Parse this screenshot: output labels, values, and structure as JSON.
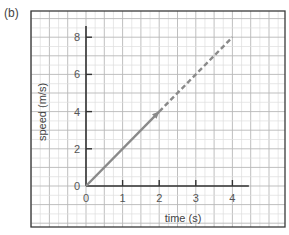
{
  "panel_label": "(b)",
  "colors": {
    "frame": "#3a3a3a",
    "axis": "#333333",
    "grid_major": "#b8b8b8",
    "grid_minor": "#dedede",
    "line": "#8a8a8a",
    "text": "#555555"
  },
  "chart_data": {
    "type": "line",
    "title": "",
    "xlabel": "time (s)",
    "ylabel": "speed (m/s)",
    "xlim": [
      0,
      4
    ],
    "ylim": [
      0,
      8
    ],
    "x_ticks": [
      "0",
      "1",
      "2",
      "3",
      "4"
    ],
    "y_ticks": [
      "0",
      "2",
      "4",
      "6",
      "8"
    ],
    "grid": true,
    "legend": null,
    "series": [
      {
        "name": "measured (solid, with arrow)",
        "style": "solid",
        "x": [
          0,
          2
        ],
        "y": [
          0,
          4
        ]
      },
      {
        "name": "extrapolated (dashed)",
        "style": "dashed",
        "x": [
          2,
          4
        ],
        "y": [
          4,
          8
        ]
      }
    ]
  }
}
